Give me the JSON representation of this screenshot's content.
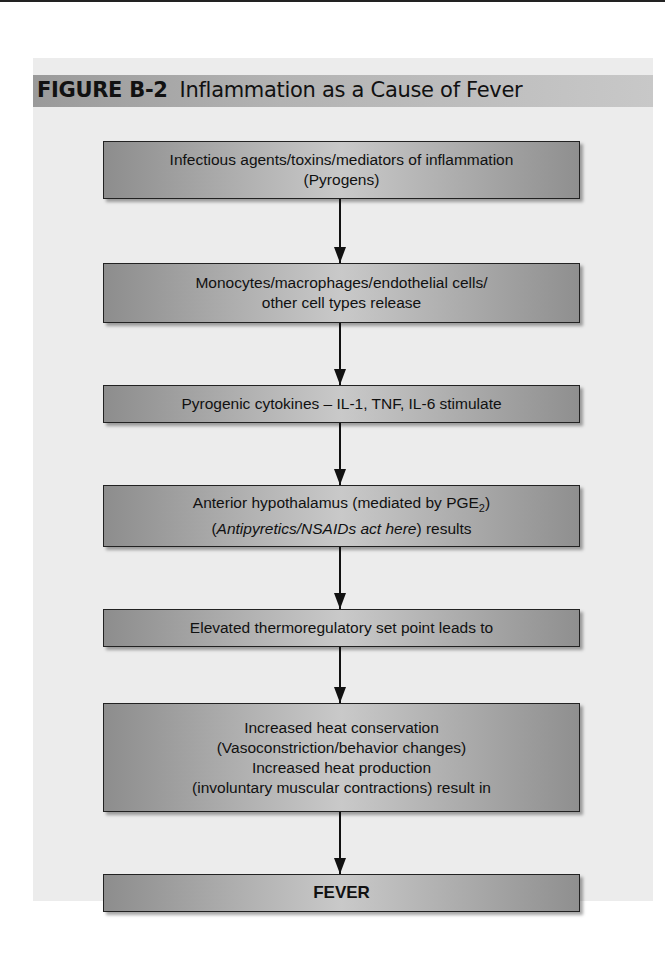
{
  "figure": {
    "label": "FIGURE B-2",
    "title": "Inflammation as a Cause of Fever"
  },
  "flowchart": {
    "steps": [
      {
        "lines": [
          "Infectious agents/toxins/mediators of inflammation",
          "(Pyrogens)"
        ]
      },
      {
        "lines": [
          "Monocytes/macrophages/endothelial cells/",
          "other cell types release"
        ]
      },
      {
        "lines": [
          "Pyrogenic cytokines – IL-1, TNF, IL-6 stimulate"
        ]
      },
      {
        "line1_prefix": "Anterior hypothalamus (mediated by PGE",
        "line1_sub": "2",
        "line1_suffix": ")",
        "line2_italic": "Antipyretics/NSAIDs act here",
        "line2_open": "(",
        "line2_suffix": ") results"
      },
      {
        "lines": [
          "Elevated thermoregulatory set point leads to"
        ]
      },
      {
        "lines": [
          "Increased heat conservation",
          "(Vasoconstriction/behavior changes)",
          "Increased heat production",
          "(involuntary muscular contractions) result in"
        ]
      },
      {
        "lines": [
          "FEVER"
        ]
      }
    ]
  },
  "colors": {
    "panel_background": "#ececec",
    "title_bar": "#b3b3b3",
    "box_fill": "#a8a8a8",
    "arrow": "#111111"
  }
}
